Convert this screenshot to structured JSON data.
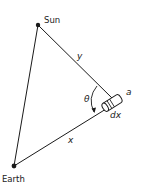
{
  "diagram": {
    "colors": {
      "stroke": "#1a1a1a",
      "background": "#ffffff"
    },
    "nodes": {
      "sun": {
        "label": "Sun",
        "x": 38,
        "y": 25
      },
      "earth": {
        "label": "Earth",
        "x": 14,
        "y": 166
      },
      "element": {
        "label": "cylinder element",
        "x": 111,
        "y": 104
      }
    },
    "edges": {
      "sun_earth": {
        "from": "sun",
        "to": "earth",
        "label": ""
      },
      "sun_element": {
        "from": "sun",
        "to": "element",
        "label": "y"
      },
      "earth_element": {
        "from": "earth",
        "to": "element",
        "label": "x"
      }
    },
    "labels": {
      "sun": "Sun",
      "earth": "Earth",
      "y": "y",
      "x": "x",
      "theta": "θ",
      "radius": "a",
      "length": "dx"
    }
  }
}
